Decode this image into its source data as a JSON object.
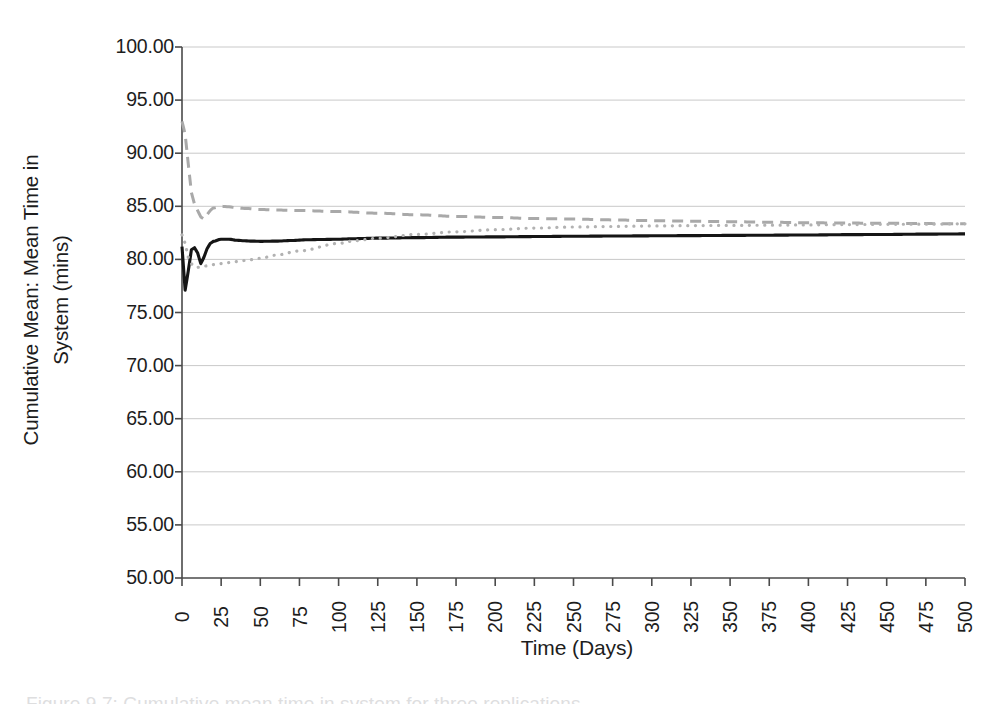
{
  "figure": {
    "caption": "Figure 9.7: Cumulative mean time in system for three replications"
  },
  "axes": {
    "ylabel_line1": "Cumulative Mean: Mean Time in",
    "ylabel_line2": "System (mins)",
    "xlabel": "Time (Days)"
  },
  "chart_data": {
    "type": "line",
    "title": "",
    "xlabel": "Time (Days)",
    "ylabel": "Cumulative Mean: Mean Time in System (mins)",
    "xlim": [
      0,
      500
    ],
    "ylim": [
      50.0,
      100.0
    ],
    "xticks": [
      0,
      25,
      50,
      75,
      100,
      125,
      150,
      175,
      200,
      225,
      250,
      275,
      300,
      325,
      350,
      375,
      400,
      425,
      450,
      475,
      500
    ],
    "xtick_labels": [
      "0",
      "25",
      "50",
      "75",
      "100",
      "125",
      "150",
      "175",
      "200",
      "225",
      "250",
      "275",
      "300",
      "325",
      "350",
      "375",
      "400",
      "425",
      "450",
      "475",
      "500"
    ],
    "yticks": [
      50,
      55,
      60,
      65,
      70,
      75,
      80,
      85,
      90,
      95,
      100
    ],
    "ytick_labels": [
      "50.00",
      "55.00",
      "60.00",
      "65.00",
      "70.00",
      "75.00",
      "80.00",
      "85.00",
      "90.00",
      "95.00",
      "100.00"
    ],
    "grid": "horizontal",
    "legend": "none",
    "series": [
      {
        "name": "Replication 1",
        "style": "solid",
        "color": "#151515",
        "width": 3.1,
        "x": [
          0,
          2,
          4,
          6,
          8,
          10,
          12,
          14,
          16,
          18,
          20,
          25,
          30,
          35,
          40,
          45,
          50,
          60,
          70,
          80,
          90,
          100,
          110,
          125,
          150,
          175,
          200,
          225,
          250,
          275,
          300,
          325,
          350,
          375,
          400,
          425,
          450,
          475,
          500
        ],
        "y": [
          81.2,
          77.1,
          78.9,
          80.9,
          81.1,
          80.6,
          79.6,
          80.2,
          81.0,
          81.5,
          81.7,
          81.9,
          81.9,
          81.8,
          81.75,
          81.72,
          81.7,
          81.72,
          81.78,
          81.85,
          81.88,
          81.9,
          81.95,
          82.0,
          82.05,
          82.1,
          82.12,
          82.15,
          82.18,
          82.2,
          82.22,
          82.24,
          82.26,
          82.28,
          82.3,
          82.33,
          82.35,
          82.38,
          82.4
        ]
      },
      {
        "name": "Replication 2",
        "style": "dashed",
        "color": "#a9a9a9",
        "width": 3.0,
        "x": [
          0,
          2,
          4,
          6,
          8,
          10,
          12,
          14,
          16,
          18,
          20,
          25,
          30,
          35,
          40,
          50,
          60,
          75,
          100,
          125,
          150,
          175,
          200,
          225,
          250,
          275,
          300,
          325,
          350,
          375,
          400,
          425,
          450,
          475,
          500
        ],
        "y": [
          93.0,
          91.8,
          89.0,
          86.3,
          85.2,
          84.6,
          84.0,
          83.8,
          84.2,
          84.6,
          84.85,
          85.0,
          84.95,
          84.85,
          84.8,
          84.7,
          84.65,
          84.6,
          84.5,
          84.35,
          84.2,
          84.05,
          83.95,
          83.85,
          83.8,
          83.72,
          83.65,
          83.6,
          83.55,
          83.5,
          83.45,
          83.42,
          83.4,
          83.37,
          83.35
        ]
      },
      {
        "name": "Replication 3",
        "style": "dotted",
        "color": "#b2b2b2",
        "width": 3.2,
        "x": [
          0,
          2,
          4,
          6,
          8,
          10,
          12,
          14,
          16,
          18,
          20,
          25,
          30,
          35,
          40,
          50,
          60,
          75,
          100,
          110,
          125,
          150,
          175,
          200,
          225,
          250,
          275,
          300,
          325,
          350,
          375,
          400,
          425,
          450,
          475,
          500
        ],
        "y": [
          82.3,
          81.5,
          80.2,
          79.6,
          79.3,
          79.25,
          79.3,
          79.35,
          79.4,
          79.45,
          79.5,
          79.6,
          79.7,
          79.8,
          79.9,
          80.1,
          80.4,
          80.8,
          81.5,
          81.75,
          82.0,
          82.35,
          82.6,
          82.8,
          82.95,
          83.05,
          83.1,
          83.15,
          83.18,
          83.2,
          83.22,
          83.25,
          83.28,
          83.3,
          83.32,
          83.35
        ]
      }
    ]
  },
  "style": {
    "grid_color": "#c9c9c9",
    "axis_color": "#4a4a4a",
    "background": "#ffffff",
    "text_color": "#1d1d1d"
  }
}
